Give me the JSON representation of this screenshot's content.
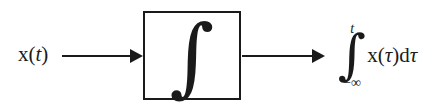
{
  "diagram": {
    "type": "block-diagram",
    "background_color": "#ffffff",
    "ink_color": "#1a1a1a",
    "input": {
      "label_x": "x",
      "label_paren_open": "(",
      "label_var": "t",
      "label_paren_close": ")",
      "full_text": "x(t)"
    },
    "block": {
      "symbol": "∫",
      "symbol_name": "integral-sign",
      "shape": "rectangle"
    },
    "arrows": {
      "input_arrow_name": "input-signal-arrow",
      "output_arrow_name": "output-signal-arrow",
      "head_style": "solid-triangle"
    },
    "output": {
      "upper_limit": "t",
      "lower_limit": "−∞",
      "integral_symbol": "∫",
      "integrand_x": "x",
      "integrand_paren_open": "(",
      "integrand_var": "τ",
      "integrand_paren_close": ")",
      "differential_d": "d",
      "differential_var": "τ",
      "full_text": "∫₋∞ᵗ x(τ)dτ"
    }
  }
}
